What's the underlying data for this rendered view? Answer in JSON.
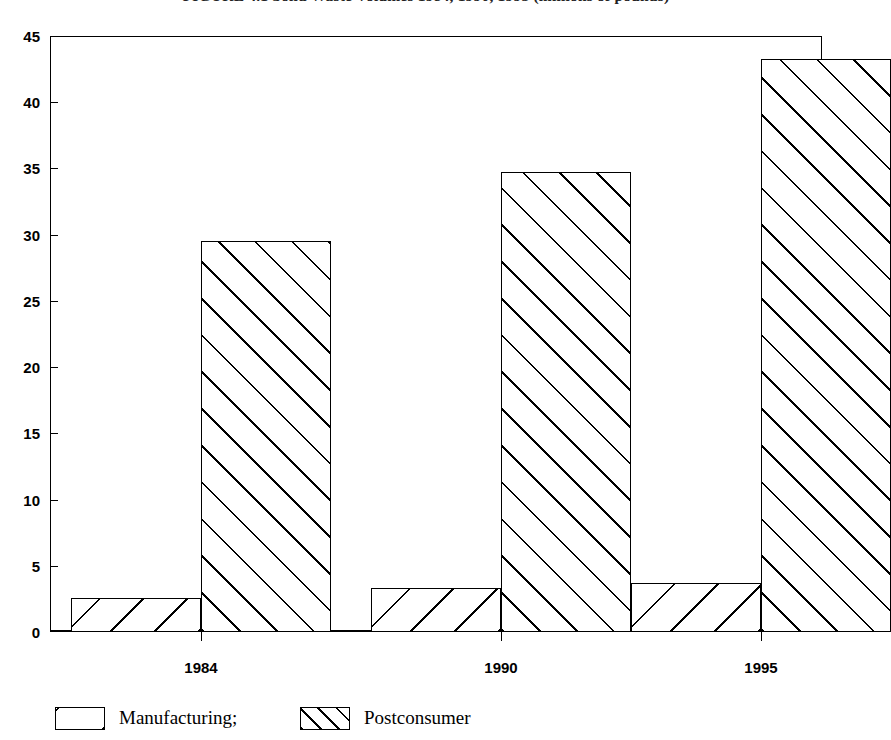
{
  "figure": {
    "caption": "FIGURE 4.1   Solid Waste Volumes 1984, 1990, 1995 (millions of pounds)"
  },
  "chart_data": {
    "type": "bar",
    "title": "FIGURE 4.1   Solid Waste Volumes 1984, 1990, 1995 (millions of pounds)",
    "xlabel": "",
    "ylabel": "",
    "categories": [
      "1984",
      "1990",
      "1995"
    ],
    "series": [
      {
        "name": "Manufacturing;",
        "values": [
          2.6,
          3.3,
          3.7
        ],
        "hatch": "backslash-sparse"
      },
      {
        "name": "Postconsumer",
        "values": [
          29.5,
          34.7,
          43.3
        ],
        "hatch": "forwardslash-dense"
      }
    ],
    "ylim": [
      0,
      45
    ],
    "ytick_step": 5,
    "yticks": [
      "0",
      "5",
      "10",
      "15",
      "20",
      "25",
      "30",
      "35",
      "40",
      "45"
    ],
    "grid": false,
    "legend_position": "bottom-left"
  },
  "legend": {
    "entries": [
      {
        "label": "Manufacturing;"
      },
      {
        "label": "Postconsumer"
      }
    ]
  }
}
